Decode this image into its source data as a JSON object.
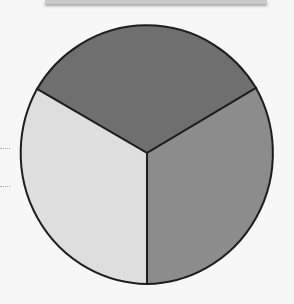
{
  "diagram": {
    "type": "pie",
    "segments": [
      {
        "name": "top",
        "color": "#6f6f6f"
      },
      {
        "name": "right",
        "color": "#8c8c8c"
      },
      {
        "name": "left",
        "color": "#dedede"
      }
    ],
    "stroke": "#1e1e1e"
  }
}
